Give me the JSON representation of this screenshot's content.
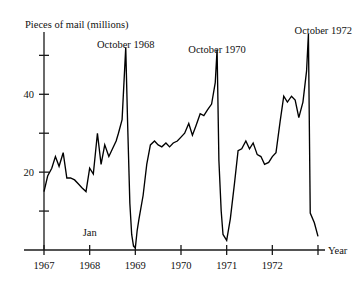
{
  "chart_data": {
    "type": "line",
    "title": "",
    "ylabel": "Pieces of mail (millions)",
    "xlabel": "Year",
    "xlim": [
      1967.0,
      1973.0
    ],
    "ylim": [
      0,
      56
    ],
    "grid": false,
    "legend": "none",
    "y_ticks": [
      10,
      20,
      30,
      40,
      50
    ],
    "y_tick_labels": [
      "",
      "20",
      "",
      "40",
      ""
    ],
    "x_ticks": [
      1967,
      1968,
      1969,
      1970,
      1971,
      1972
    ],
    "x_tick_labels": [
      "1967",
      "1968",
      "1969",
      "1970",
      "1971",
      "1972"
    ],
    "annotations": [
      {
        "text": "October 1968",
        "x": 1968.79,
        "y": 52.0
      },
      {
        "text": "October 1970",
        "x": 1970.79,
        "y": 50.5
      },
      {
        "text": "October 1972",
        "x": 1972.79,
        "y": 55.5
      },
      {
        "text": "Jan",
        "x": 1968.0,
        "y": 3.5
      }
    ],
    "series": [
      {
        "name": "Pieces of mail (millions)",
        "x": [
          1967.0,
          1967.08,
          1967.17,
          1967.25,
          1967.33,
          1967.42,
          1967.5,
          1967.58,
          1967.67,
          1967.75,
          1967.83,
          1967.92,
          1968.0,
          1968.08,
          1968.17,
          1968.25,
          1968.33,
          1968.42,
          1968.5,
          1968.58,
          1968.63,
          1968.71,
          1968.79,
          1968.83,
          1968.88,
          1968.92,
          1968.96,
          1969.0,
          1969.04,
          1969.08,
          1969.17,
          1969.25,
          1969.33,
          1969.42,
          1969.5,
          1969.58,
          1969.67,
          1969.75,
          1969.83,
          1969.92,
          1970.0,
          1970.08,
          1970.17,
          1970.25,
          1970.33,
          1970.42,
          1970.5,
          1970.58,
          1970.67,
          1970.75,
          1970.79,
          1970.83,
          1970.88,
          1970.92,
          1971.0,
          1971.08,
          1971.17,
          1971.25,
          1971.33,
          1971.42,
          1971.5,
          1971.58,
          1971.67,
          1971.75,
          1971.83,
          1971.92,
          1972.0,
          1972.08,
          1972.17,
          1972.25,
          1972.33,
          1972.42,
          1972.5,
          1972.58,
          1972.67,
          1972.75,
          1972.79,
          1972.83,
          1972.92,
          1973.0
        ],
        "values": [
          15.0,
          19.0,
          21.0,
          24.0,
          21.5,
          25.0,
          18.5,
          18.5,
          18.0,
          17.0,
          16.0,
          15.0,
          21.0,
          19.5,
          30.0,
          22.0,
          27.0,
          24.0,
          26.0,
          28.0,
          30.0,
          33.5,
          52.0,
          33.0,
          12.0,
          4.0,
          1.0,
          0.5,
          5.0,
          8.0,
          14.0,
          22.0,
          27.0,
          28.0,
          27.0,
          26.5,
          27.5,
          26.5,
          27.5,
          28.0,
          29.0,
          30.0,
          32.5,
          29.5,
          32.0,
          35.0,
          34.5,
          36.0,
          37.5,
          43.0,
          51.5,
          23.0,
          10.0,
          4.0,
          2.5,
          8.0,
          17.0,
          25.5,
          26.0,
          28.0,
          26.0,
          27.5,
          24.5,
          24.0,
          22.0,
          22.5,
          24.0,
          25.0,
          33.0,
          39.5,
          38.0,
          39.5,
          38.5,
          34.0,
          38.0,
          46.0,
          55.5,
          9.5,
          7.0,
          3.5
        ]
      }
    ]
  }
}
